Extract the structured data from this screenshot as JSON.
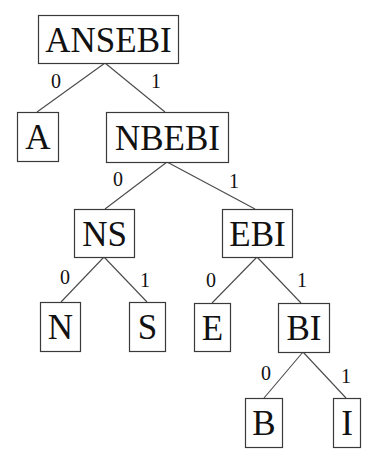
{
  "diagram": {
    "type": "binary-code-tree",
    "nodes": [
      {
        "id": "ANSEBI",
        "label": "ANSEBI",
        "x": 38,
        "y": 15,
        "w": 140,
        "h": 48
      },
      {
        "id": "A",
        "label": "A",
        "x": 17,
        "y": 112,
        "w": 41,
        "h": 49
      },
      {
        "id": "NBEBI",
        "label": "NBEBI",
        "x": 106,
        "y": 112,
        "w": 122,
        "h": 50
      },
      {
        "id": "NS",
        "label": "NS",
        "x": 74,
        "y": 209,
        "w": 60,
        "h": 48
      },
      {
        "id": "EBI",
        "label": "EBI",
        "x": 222,
        "y": 209,
        "w": 70,
        "h": 48
      },
      {
        "id": "N",
        "label": "N",
        "x": 40,
        "y": 302,
        "w": 40,
        "h": 49
      },
      {
        "id": "S",
        "label": "S",
        "x": 129,
        "y": 302,
        "w": 36,
        "h": 49
      },
      {
        "id": "E",
        "label": "E",
        "x": 194,
        "y": 303,
        "w": 36,
        "h": 48
      },
      {
        "id": "BI",
        "label": "BI",
        "x": 278,
        "y": 303,
        "w": 51,
        "h": 49
      },
      {
        "id": "B",
        "label": "B",
        "x": 245,
        "y": 398,
        "w": 37,
        "h": 49
      },
      {
        "id": "I",
        "label": "I",
        "x": 333,
        "y": 398,
        "w": 27,
        "h": 49
      }
    ],
    "edges": [
      {
        "from": "ANSEBI",
        "to": "A",
        "label": "0",
        "x1": 105,
        "y1": 63,
        "x2": 37,
        "y2": 112,
        "lx": 56,
        "ly": 88
      },
      {
        "from": "ANSEBI",
        "to": "NBEBI",
        "label": "1",
        "x1": 105,
        "y1": 63,
        "x2": 165,
        "y2": 112,
        "lx": 156,
        "ly": 88
      },
      {
        "from": "NBEBI",
        "to": "NS",
        "label": "0",
        "x1": 167,
        "y1": 162,
        "x2": 105,
        "y2": 209,
        "lx": 118,
        "ly": 186
      },
      {
        "from": "NBEBI",
        "to": "EBI",
        "label": "1",
        "x1": 167,
        "y1": 162,
        "x2": 255,
        "y2": 209,
        "lx": 234,
        "ly": 188
      },
      {
        "from": "NS",
        "to": "N",
        "label": "0",
        "x1": 104,
        "y1": 257,
        "x2": 61,
        "y2": 302,
        "lx": 65,
        "ly": 284
      },
      {
        "from": "NS",
        "to": "S",
        "label": "1",
        "x1": 104,
        "y1": 257,
        "x2": 147,
        "y2": 302,
        "lx": 145,
        "ly": 287
      },
      {
        "from": "EBI",
        "to": "E",
        "label": "0",
        "x1": 257,
        "y1": 257,
        "x2": 212,
        "y2": 303,
        "lx": 211,
        "ly": 287
      },
      {
        "from": "EBI",
        "to": "BI",
        "label": "1",
        "x1": 257,
        "y1": 257,
        "x2": 301,
        "y2": 303,
        "lx": 302,
        "ly": 287
      },
      {
        "from": "BI",
        "to": "B",
        "label": "0",
        "x1": 303,
        "y1": 352,
        "x2": 264,
        "y2": 398,
        "lx": 266,
        "ly": 380
      },
      {
        "from": "BI",
        "to": "I",
        "label": "1",
        "x1": 303,
        "y1": 352,
        "x2": 346,
        "y2": 398,
        "lx": 346,
        "ly": 383
      }
    ]
  }
}
